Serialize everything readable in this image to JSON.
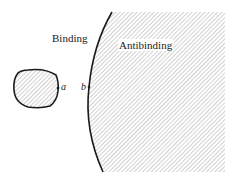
{
  "diagram": {
    "regions": {
      "binding": {
        "label": "Binding"
      },
      "antibinding": {
        "label": "Antibinding"
      }
    },
    "points": {
      "a": {
        "label": "a"
      },
      "b": {
        "label": "b"
      }
    },
    "colors": {
      "stroke": "#1a1a1a",
      "hatch": "#8c8c8c",
      "background": "#ffffff"
    }
  }
}
